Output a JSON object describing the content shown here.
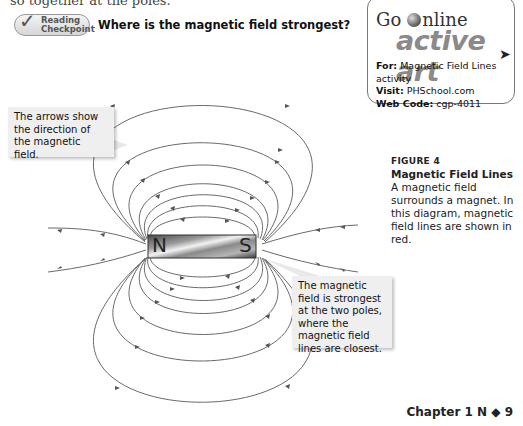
{
  "page": {
    "clipped_top_text": "so together at the poles."
  },
  "checkpoint": {
    "badge_line1": "Reading",
    "badge_line2": "Checkpoint",
    "question": "Where is the magnetic field strongest?"
  },
  "go_online": {
    "title_go": "Go",
    "title_online": "nline",
    "brand": "active art",
    "for_label": "For:",
    "for_value": "Magnetic Field Lines activity",
    "visit_label": "Visit:",
    "visit_value": "PHSchool.com",
    "code_label": "Web Code:",
    "code_value": "cgp-4011"
  },
  "figure": {
    "label": "FIGURE 4",
    "title": "Magnetic Field Lines",
    "description": "A magnetic field surrounds a magnet. In this diagram, magnetic field lines are shown in red."
  },
  "diagram": {
    "magnet": {
      "north_label": "N",
      "south_label": "S"
    },
    "callouts": [
      {
        "text": "The arrows show the direction of the magnetic field."
      },
      {
        "text": "The magnetic field is strongest at the two poles, where the magnetic field lines are closest."
      }
    ],
    "line_color": "#666666"
  },
  "footer": {
    "text": "Chapter 1  N ◆ 9"
  }
}
